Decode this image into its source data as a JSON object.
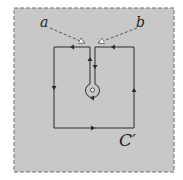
{
  "labels": {
    "point_a": "a",
    "point_b": "b",
    "contour": "C′"
  },
  "colors": {
    "background": "#c8c8c8",
    "border": "#707070",
    "line": "#2a2a2a",
    "dashed_arrow": "#555555"
  }
}
